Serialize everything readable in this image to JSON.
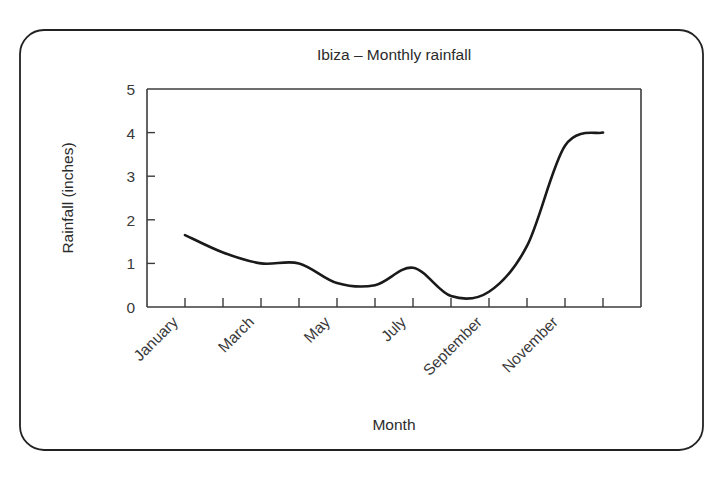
{
  "figure": {
    "outer_frame": {
      "x": 20,
      "y": 30,
      "width": 683,
      "height": 420,
      "radius": 24,
      "stroke_color": "#222222"
    },
    "plot_area": {
      "left": 147,
      "top": 89,
      "right": 641,
      "bottom": 307
    }
  },
  "chart_data": {
    "type": "line",
    "title": "Ibiza – Monthly rainfall",
    "xlabel": "Month",
    "ylabel": "Rainfall (inches)",
    "categories": [
      "January",
      "February",
      "March",
      "April",
      "May",
      "June",
      "July",
      "August",
      "September",
      "October",
      "November",
      "December"
    ],
    "values": [
      1.65,
      1.25,
      1.0,
      1.0,
      0.55,
      0.5,
      0.9,
      0.25,
      0.35,
      1.4,
      3.7,
      4.0
    ],
    "series": [
      {
        "name": "Rainfall",
        "values": [
          1.65,
          1.25,
          1.0,
          1.0,
          0.55,
          0.5,
          0.9,
          0.25,
          0.35,
          1.4,
          3.7,
          4.0
        ],
        "color": "#1a1a1a"
      }
    ],
    "ylim": [
      0,
      5
    ],
    "yticks": [
      0,
      1,
      2,
      3,
      4,
      5
    ],
    "ytick_labels": [
      "0",
      "1",
      "2",
      "3",
      "4",
      "5"
    ],
    "xtick_labels": [
      "January",
      "March",
      "May",
      "July",
      "September",
      "November"
    ],
    "xtick_rotation_deg": -45,
    "grid": false,
    "legend": null,
    "annotations": [],
    "peak_value": 4.05,
    "minimum_value": 0.2,
    "end_value": 1.9,
    "line_color": "#1a1a1a"
  }
}
